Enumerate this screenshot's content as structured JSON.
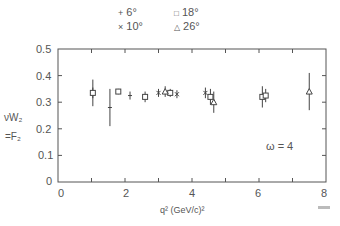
{
  "chart_data": {
    "type": "scatter",
    "title": "",
    "xlabel": "q² (GeV/c)²",
    "ylabel": "νW₂ = F₂",
    "xlim": [
      0,
      8
    ],
    "ylim": [
      0,
      0.5
    ],
    "xticks": [
      "0",
      "2",
      "4",
      "6",
      "8"
    ],
    "yticks": [
      "0",
      "0.1",
      "0.2",
      "0.3",
      "0.4",
      "0.5"
    ],
    "grid": false,
    "legend_position": "top",
    "annotation": "ω = 4",
    "legend": [
      {
        "label": "6°",
        "marker": "plus"
      },
      {
        "label": "10°",
        "marker": "x"
      },
      {
        "label": "18°",
        "marker": "square"
      },
      {
        "label": "26°",
        "marker": "triangle"
      }
    ],
    "series": [
      {
        "name": "6°",
        "marker": "plus",
        "points": [
          {
            "x": 1.04,
            "y": 0.335,
            "err": 0.05
          },
          {
            "x": 1.55,
            "y": 0.28,
            "err": 0.07
          },
          {
            "x": 2.15,
            "y": 0.325,
            "err": 0.015
          }
        ]
      },
      {
        "name": "10°",
        "marker": "x",
        "points": [
          {
            "x": 3.0,
            "y": 0.335,
            "err": 0.015
          },
          {
            "x": 3.55,
            "y": 0.33,
            "err": 0.015
          },
          {
            "x": 4.4,
            "y": 0.335,
            "err": 0.02
          }
        ]
      },
      {
        "name": "18°",
        "marker": "square",
        "points": [
          {
            "x": 1.04,
            "y": 0.335,
            "err": 0.02
          },
          {
            "x": 1.8,
            "y": 0.34,
            "err": 0.01
          },
          {
            "x": 2.6,
            "y": 0.32,
            "err": 0.02
          },
          {
            "x": 3.35,
            "y": 0.335,
            "err": 0.015
          },
          {
            "x": 4.55,
            "y": 0.32,
            "err": 0.03
          },
          {
            "x": 6.1,
            "y": 0.32,
            "err": 0.04
          },
          {
            "x": 6.2,
            "y": 0.325,
            "err": 0.025
          }
        ]
      },
      {
        "name": "26°",
        "marker": "triangle",
        "points": [
          {
            "x": 3.2,
            "y": 0.34,
            "err": 0.02
          },
          {
            "x": 4.65,
            "y": 0.3,
            "err": 0.04
          },
          {
            "x": 7.5,
            "y": 0.34,
            "err": 0.07
          }
        ]
      }
    ]
  },
  "labels": {
    "ylabel_line1": "νW₂",
    "ylabel_line2": "=F₂",
    "xlabel": "q² (GeV/c)²",
    "annotation": "ω = 4",
    "legend_6": "6°",
    "legend_10": "10°",
    "legend_18": "18°",
    "legend_26": "26°"
  }
}
